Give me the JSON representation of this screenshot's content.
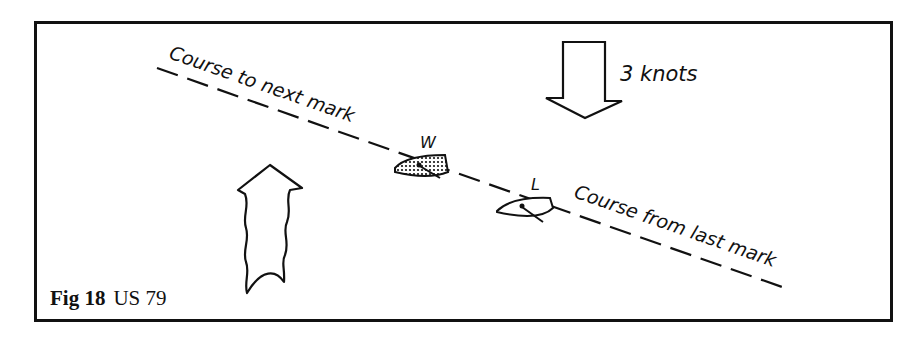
{
  "figure": {
    "caption": {
      "fig_label": "Fig 18",
      "reference": "US 79"
    },
    "labels": {
      "course_to_next_mark": "Course to next mark",
      "course_from_last_mark": "Course from last mark",
      "current_speed": "3 knots",
      "windward_boat": "W",
      "leeward_boat": "L"
    },
    "icons": {
      "current_arrow": "down-arrow-icon",
      "wind_arrow": "wavy-up-arrow-icon",
      "windward_boat": "shaded-boat-icon",
      "leeward_boat": "boat-icon"
    },
    "colors": {
      "ink": "#111111",
      "background": "#ffffff"
    }
  }
}
